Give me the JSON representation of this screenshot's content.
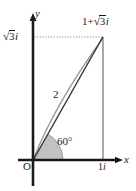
{
  "figure": {
    "type": "diagram",
    "axes": {
      "x_label": "x",
      "y_label": "y",
      "origin_label": "O"
    },
    "labels": {
      "point_label_real": "1",
      "point_label_plus": "+",
      "point_label_radical_sign": "√",
      "point_label_radicand": "3",
      "point_label_imag_unit": "i",
      "y_intercept_radical_sign": "√",
      "y_intercept_radicand": "3",
      "y_intercept_imag_unit": "i",
      "modulus": "2",
      "angle": "60°",
      "x_intercept_value": "1",
      "x_intercept_imag_unit": "i"
    },
    "colors": {
      "axis": "#1a1a1a",
      "dark_line": "#3b3b3b",
      "light_line": "#9a9a9a",
      "dotted_line": "#8c8c8c",
      "drop_line": "#6f6f6f",
      "sector_fill": "#b7b7b7",
      "sector_stroke": "#7a7a7a",
      "text": "#1a1a1a",
      "background": "#ffffff"
    },
    "geometry": {
      "origin_px": [
        33,
        160
      ],
      "point_px": [
        103,
        37
      ],
      "x_axis_y_px": 160,
      "y_axis_x_px": 33,
      "angle_degrees": 60,
      "modulus_value": 2,
      "real_part": 1,
      "imaginary_part": 1.7320508
    }
  }
}
